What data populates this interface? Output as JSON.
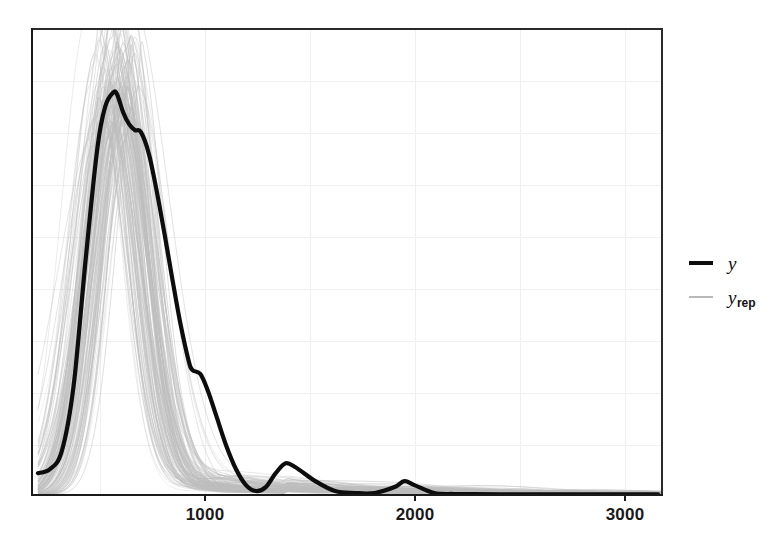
{
  "chart_data": {
    "type": "line",
    "title": "",
    "subtitle": "",
    "xlabel": "",
    "ylabel": "",
    "xlim": [
      -30,
      3150
    ],
    "ylim": [
      0,
      0.00235
    ],
    "grid": true,
    "grid_x_step": 500,
    "grid_y_lines": 8,
    "xticks": [
      1000,
      2000,
      3000
    ],
    "xticklabels": [
      "1000",
      "2000",
      "3000"
    ],
    "yticks": [],
    "yticklabels": [],
    "legend_position": "right",
    "axis_line_color": "#1a1a1a",
    "grid_color": "#efefef",
    "background": "#ffffff",
    "series": [
      {
        "name": "y",
        "label": "y",
        "role": "observed",
        "color": "#0d0d0d",
        "linewidth": 4,
        "opacity": 1,
        "description": "Observed data kernel density: sharp primary mode near 400 with a shoulder near 520, secondary bumps near 780, 1150 and 1850.",
        "x": [
          0,
          60,
          120,
          180,
          240,
          300,
          340,
          380,
          400,
          430,
          460,
          490,
          520,
          560,
          600,
          640,
          680,
          720,
          760,
          780,
          820,
          860,
          900,
          950,
          1000,
          1050,
          1100,
          1150,
          1200,
          1250,
          1300,
          1400,
          1500,
          1600,
          1700,
          1800,
          1850,
          1900,
          2000,
          2100,
          2200,
          2400,
          2600,
          2800,
          3000,
          3130
        ],
        "y": [
          0.00011,
          0.00013,
          0.00022,
          0.00055,
          0.00118,
          0.00175,
          0.00196,
          0.00203,
          0.00202,
          0.00193,
          0.00187,
          0.00184,
          0.00183,
          0.00172,
          0.00153,
          0.00131,
          0.00108,
          0.00086,
          0.00068,
          0.00063,
          0.00061,
          0.00052,
          0.0004,
          0.00025,
          0.00013,
          5e-05,
          2e-05,
          4e-05,
          0.00011,
          0.00016,
          0.00014,
          7e-05,
          2e-05,
          1e-05,
          1e-05,
          4e-05,
          7e-05,
          5e-05,
          1e-05,
          5e-06,
          4e-06,
          3e-06,
          3e-06,
          3e-06,
          3e-06,
          3e-06
        ]
      },
      {
        "name": "y_rep",
        "label": "y rep",
        "role": "replicated",
        "color": "#bdbdbd",
        "linewidth": 0.8,
        "opacity": 0.55,
        "n_draws": 120,
        "description": "120 posterior predictive replicate densities; unimodal peaks between 330 and 520 with heights ranging about 0.0017 to 0.0023, plus a long low right tail extending past 3000."
      }
    ]
  },
  "axis": {
    "xticklabels": [
      "1000",
      "2000",
      "3000"
    ]
  },
  "legend": {
    "items": [
      {
        "label": "y",
        "subscript": "",
        "key": "thick-black-line"
      },
      {
        "label": "y",
        "subscript": "rep",
        "key": "thin-gray-line"
      }
    ]
  }
}
